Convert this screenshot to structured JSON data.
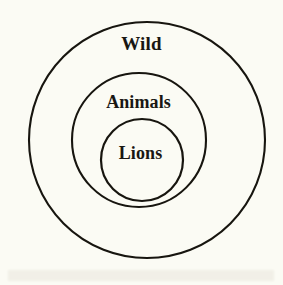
{
  "diagram": {
    "type": "nested-euler-diagram",
    "background_color": "#fbfbf4",
    "stroke_color": "#17150f",
    "text_color": "#191713",
    "rings": [
      {
        "label": "Wild",
        "level": 1,
        "name": "outer-circle",
        "cx": 147,
        "cy": 140,
        "r": 118,
        "stroke_width": 2.1
      },
      {
        "label": "Animals",
        "level": 2,
        "name": "middle-circle",
        "cx": 139,
        "cy": 140,
        "r": 67,
        "stroke_width": 2.1
      },
      {
        "label": "Lions",
        "level": 3,
        "name": "inner-circle",
        "cx": 142,
        "cy": 160,
        "r": 41,
        "stroke_width": 2.2
      }
    ]
  }
}
